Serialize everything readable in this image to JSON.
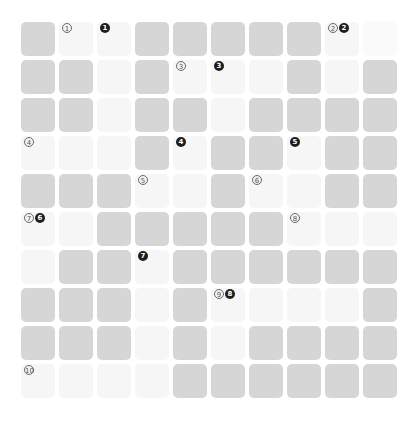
{
  "puzzle": {
    "type": "crossword-grid",
    "rows": 10,
    "cols": 10,
    "colors": {
      "block": "#d6d6d6",
      "open": "#f6f6f6",
      "open_faint": "#fafafa",
      "across_marker": "#6a6a6a",
      "down_marker": "#1e1e1e"
    },
    "legend": {
      "across_style": "outlined-circled-number",
      "down_style": "filled-circled-number"
    },
    "grid": [
      [
        "D",
        "L",
        "L",
        "D",
        "D",
        "D",
        "D",
        "D",
        "L",
        "F"
      ],
      [
        "D",
        "D",
        "L",
        "D",
        "L",
        "L",
        "L",
        "D",
        "L",
        "D"
      ],
      [
        "D",
        "D",
        "L",
        "D",
        "D",
        "L",
        "D",
        "D",
        "D",
        "D"
      ],
      [
        "L",
        "L",
        "L",
        "D",
        "L",
        "D",
        "D",
        "L",
        "D",
        "D"
      ],
      [
        "D",
        "D",
        "D",
        "L",
        "L",
        "D",
        "L",
        "L",
        "D",
        "D"
      ],
      [
        "L",
        "L",
        "D",
        "D",
        "D",
        "D",
        "D",
        "L",
        "L",
        "L"
      ],
      [
        "L",
        "D",
        "D",
        "L",
        "D",
        "D",
        "D",
        "D",
        "D",
        "D"
      ],
      [
        "D",
        "D",
        "D",
        "L",
        "D",
        "L",
        "L",
        "L",
        "L",
        "D"
      ],
      [
        "D",
        "D",
        "D",
        "L",
        "D",
        "L",
        "D",
        "D",
        "D",
        "D"
      ],
      [
        "L",
        "L",
        "L",
        "L",
        "D",
        "D",
        "D",
        "D",
        "D",
        "D"
      ]
    ],
    "clues": [
      {
        "row": 0,
        "col": 1,
        "across": "1",
        "down": ""
      },
      {
        "row": 0,
        "col": 2,
        "across": "",
        "down": "1"
      },
      {
        "row": 0,
        "col": 8,
        "across": "2",
        "down": "2"
      },
      {
        "row": 1,
        "col": 4,
        "across": "3",
        "down": ""
      },
      {
        "row": 1,
        "col": 5,
        "across": "",
        "down": "3"
      },
      {
        "row": 3,
        "col": 0,
        "across": "4",
        "down": ""
      },
      {
        "row": 3,
        "col": 4,
        "across": "",
        "down": "4"
      },
      {
        "row": 3,
        "col": 7,
        "across": "",
        "down": "5"
      },
      {
        "row": 4,
        "col": 3,
        "across": "5",
        "down": ""
      },
      {
        "row": 4,
        "col": 6,
        "across": "6",
        "down": ""
      },
      {
        "row": 5,
        "col": 0,
        "across": "7",
        "down": "6"
      },
      {
        "row": 5,
        "col": 7,
        "across": "8",
        "down": ""
      },
      {
        "row": 6,
        "col": 3,
        "across": "",
        "down": "7"
      },
      {
        "row": 7,
        "col": 5,
        "across": "9",
        "down": "8"
      },
      {
        "row": 9,
        "col": 0,
        "across": "10",
        "down": ""
      }
    ]
  }
}
